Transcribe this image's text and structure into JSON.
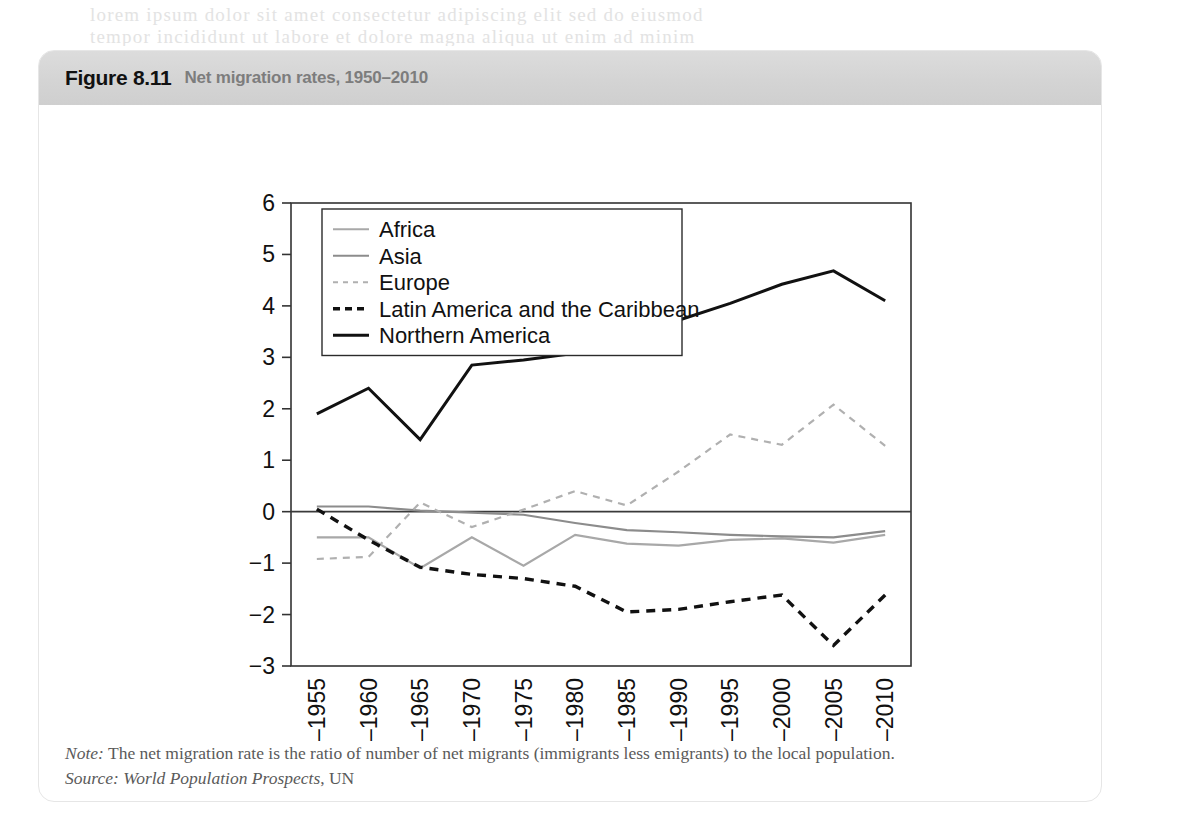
{
  "page": {
    "bleed_lines": [
      "lorem ipsum dolor sit amet consectetur adipiscing elit sed do eiusmod",
      "tempor incididunt ut labore et dolore magna aliqua ut enim ad minim"
    ]
  },
  "figure": {
    "number": "Figure 8.11",
    "title": "Net migration rates, 1950–2010",
    "note_label": "Note:",
    "note_text": "The net migration rate is the ratio of number of net migrants (immigrants less emigrants) to the local population.",
    "source_label": "Source:",
    "source_italic": "World Population Prospects",
    "source_rest": ", UN"
  },
  "colors": {
    "header_band": "#d4d4d4",
    "figure_number": "#111111",
    "figure_title": "#7d7d7d",
    "axis": "#333333",
    "africa": "#a8a8a8",
    "asia": "#8c8c8c",
    "europe": "#b0b0b0",
    "latin_america": "#111111",
    "northern_america": "#111111",
    "note_text": "#5a5a5a"
  },
  "chart_data": {
    "type": "line",
    "title": "Net migration rates, 1950–2010",
    "xlabel": "",
    "ylabel": "",
    "ylim": [
      -3,
      6
    ],
    "yticks": [
      -3,
      -2,
      -1,
      0,
      1,
      2,
      3,
      4,
      5,
      6
    ],
    "ytick_labels": [
      "−3",
      "−2",
      "−1",
      "0",
      "1",
      "2",
      "3",
      "4",
      "5",
      "6"
    ],
    "grid": false,
    "zero_line": true,
    "legend_position": "top-left-inside",
    "categories": [
      "1950–1955",
      "1955–1960",
      "1960–1965",
      "1965–1970",
      "1970–1975",
      "1975–1980",
      "1980–1985",
      "1985–1990",
      "1990–1995",
      "1995–2000",
      "2000–2005",
      "2005–2010"
    ],
    "series": [
      {
        "name": "Africa",
        "style": "solid",
        "color": "#a8a8a8",
        "width": 2.2,
        "values": [
          -0.5,
          -0.5,
          -1.1,
          -0.5,
          -1.05,
          -0.45,
          -0.62,
          -0.66,
          -0.55,
          -0.52,
          -0.6,
          -0.45
        ]
      },
      {
        "name": "Asia",
        "style": "solid",
        "color": "#8c8c8c",
        "width": 2.2,
        "values": [
          0.1,
          0.1,
          0.02,
          -0.02,
          -0.06,
          -0.22,
          -0.36,
          -0.4,
          -0.45,
          -0.48,
          -0.5,
          -0.38
        ]
      },
      {
        "name": "Europe",
        "style": "dashed",
        "color": "#b0b0b0",
        "width": 2.2,
        "values": [
          -0.92,
          -0.88,
          0.18,
          -0.3,
          0.04,
          0.4,
          0.12,
          0.78,
          1.5,
          1.3,
          2.08,
          1.28
        ]
      },
      {
        "name": "Latin America and the Caribbean",
        "style": "dashed",
        "color": "#111111",
        "width": 3.4,
        "values": [
          0.05,
          -0.55,
          -1.08,
          -1.22,
          -1.3,
          -1.45,
          -1.95,
          -1.9,
          -1.75,
          -1.62,
          -2.6,
          -1.62
        ]
      },
      {
        "name": "Northern America",
        "style": "solid",
        "color": "#111111",
        "width": 3.0,
        "values": [
          1.9,
          2.4,
          1.4,
          2.85,
          2.95,
          3.08,
          3.42,
          3.72,
          4.05,
          4.42,
          4.68,
          4.1
        ]
      }
    ]
  }
}
